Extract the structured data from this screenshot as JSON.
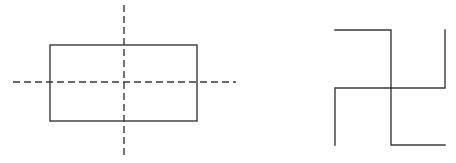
{
  "figures": [
    {
      "id": "rectangle-with-symmetry-axes",
      "description": "Rectangle with its two lines of symmetry (vertical and horizontal), shown dashed",
      "shape": "rectangle",
      "axes_of_symmetry": [
        "vertical",
        "horizontal"
      ],
      "axis_line_style": "dashed"
    },
    {
      "id": "rotational-symmetry-figure",
      "description": "Four-armed figure with right-angle bends, having rotational symmetry of order 4 and no line symmetry",
      "shape": "four-armed bent cross",
      "rotational_symmetry_order": 4
    }
  ],
  "colors": {
    "stroke": "#3a3a3a",
    "background": "#ffffff"
  }
}
